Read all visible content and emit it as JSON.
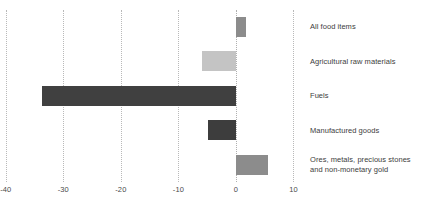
{
  "chart_data": {
    "type": "bar",
    "orientation": "horizontal",
    "title": "",
    "subtitle": "",
    "xlabel": "",
    "ylabel": "",
    "categories": [
      "All food items",
      "Agricultural raw materials",
      "Fuels",
      "Manufactured goods",
      "Ores, metals, precious stones and non-monetary gold"
    ],
    "values": [
      1.7,
      -5.9,
      -33.7,
      -4.9,
      5.6
    ],
    "bar_colors": [
      "#8c8c8c",
      "#c4c4c4",
      "#404040",
      "#3d3d3d",
      "#8c8c8c"
    ],
    "xlim": [
      -41,
      12
    ],
    "xticks": [
      -40,
      -30,
      -20,
      -10,
      0,
      10
    ],
    "xtick_labels": [
      "-40",
      "-30",
      "-20",
      "-10",
      "0",
      "10"
    ],
    "grid": true,
    "grid_style": "dotted",
    "grid_color": "#b9b9b9",
    "legend": false,
    "legend_position": "none",
    "label_position": "right-of-plot",
    "zero_line": 0
  },
  "category_label_lines": [
    [
      "All food items"
    ],
    [
      "Agricultural raw materials"
    ],
    [
      "Fuels"
    ],
    [
      "Manufactured goods"
    ],
    [
      "Ores, metals, precious stones",
      "and non-monetary gold"
    ]
  ]
}
